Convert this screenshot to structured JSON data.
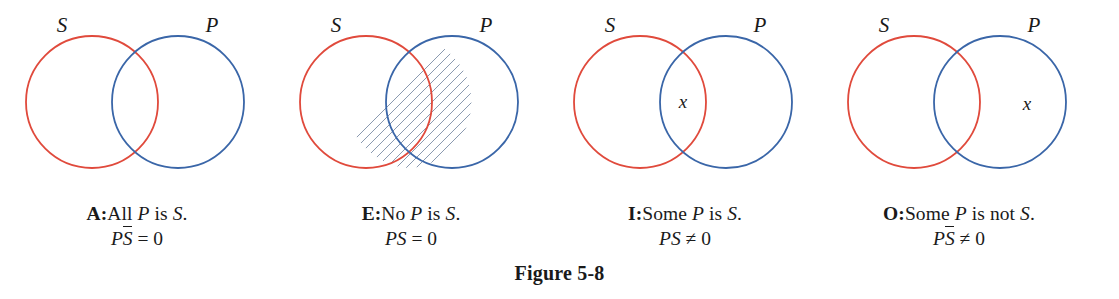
{
  "figure": {
    "label": "Figure 5-8",
    "colors": {
      "subject_circle": "#e04a3c",
      "predicate_circle": "#3a66a8",
      "hatch": "#7d8da6",
      "text": "#1a1a1a"
    },
    "geometry": {
      "s_center_x": 92,
      "p_center_x": 178,
      "center_y": 102,
      "radius": 66
    }
  },
  "panels": [
    {
      "id": "panel-a",
      "letter": "A:",
      "statement_parts": {
        "quantifier": "All ",
        "subject_term": "P",
        "copula": " is ",
        "predicate_term": "S",
        "period": "."
      },
      "statement_text": "A: All P is S.",
      "formula": {
        "left": "P",
        "barred": "S",
        "relation": " = 0"
      },
      "formula_text": "PS̄ = 0",
      "set_labels": {
        "left": "S",
        "right": "P"
      },
      "shading": "p-only",
      "x_mark": null,
      "x_position": null
    },
    {
      "id": "panel-e",
      "letter": "E:",
      "statement_parts": {
        "quantifier": "No ",
        "subject_term": "P",
        "copula": " is ",
        "predicate_term": "S",
        "period": "."
      },
      "statement_text": "E: No P is S.",
      "formula": {
        "left": "PS",
        "barred": null,
        "relation": " = 0"
      },
      "formula_text": "PS = 0",
      "set_labels": {
        "left": "S",
        "right": "P"
      },
      "shading": "intersection",
      "x_mark": null,
      "x_position": null
    },
    {
      "id": "panel-i",
      "letter": "I:",
      "statement_parts": {
        "quantifier": "Some ",
        "subject_term": "P",
        "copula": " is ",
        "predicate_term": "S",
        "period": "."
      },
      "statement_text": "I: Some P is S.",
      "formula": {
        "left": "PS",
        "barred": null,
        "relation": " ≠ 0"
      },
      "formula_text": "PS ≠ 0",
      "set_labels": {
        "left": "S",
        "right": "P"
      },
      "shading": "none",
      "x_mark": "x",
      "x_position": "intersection"
    },
    {
      "id": "panel-o",
      "letter": "O:",
      "statement_parts": {
        "quantifier": "Some ",
        "subject_term": "P",
        "copula": " is not ",
        "predicate_term": "S",
        "period": "."
      },
      "statement_text": "O: Some P is not S.",
      "formula": {
        "left": "P",
        "barred": "S",
        "relation": " ≠ 0"
      },
      "formula_text": "PS̄ ≠ 0",
      "set_labels": {
        "left": "S",
        "right": "P"
      },
      "shading": "none",
      "x_mark": "x",
      "x_position": "p-only"
    }
  ]
}
